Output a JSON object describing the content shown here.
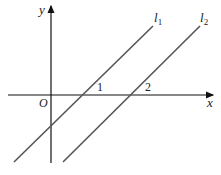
{
  "diagram": {
    "type": "coordinate-plane",
    "axes": {
      "x_label": "x",
      "y_label": "y",
      "origin_label": "O",
      "x_ticks": [
        "1",
        "2"
      ]
    },
    "lines": [
      {
        "name": "l",
        "subscript": "1",
        "x_intercept": "1"
      },
      {
        "name": "l",
        "subscript": "2",
        "x_intercept": "2"
      }
    ],
    "colors": {
      "axis": "#111111",
      "line": "#555555",
      "text": "#222222"
    }
  }
}
